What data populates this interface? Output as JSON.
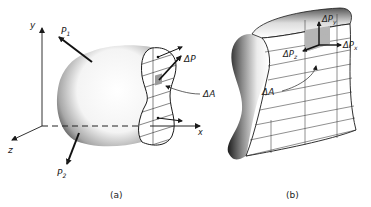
{
  "figure": {
    "panel_a": {
      "caption": "(a)",
      "axes": {
        "x": "x",
        "y": "y",
        "z": "z"
      },
      "forces": [
        {
          "symbol": "P",
          "subscript": "1"
        },
        {
          "symbol": "P",
          "subscript": "2"
        }
      ],
      "resultant_label": "ΔP",
      "area_label": "ΔA"
    },
    "panel_b": {
      "caption": "(b)",
      "components": [
        {
          "symbol": "ΔP",
          "subscript": "y"
        },
        {
          "symbol": "ΔP",
          "subscript": "x"
        },
        {
          "symbol": "ΔP",
          "subscript": "z"
        }
      ],
      "area_label": "ΔA"
    },
    "colors": {
      "ink": "#1a1a1a",
      "shade": "#9a9a9a",
      "element_fill": "#b5b5b5"
    }
  }
}
